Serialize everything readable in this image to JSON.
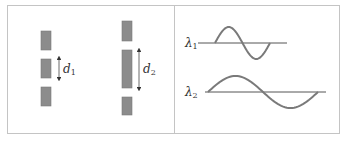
{
  "figure": {
    "left_panel": {
      "title": "Slits with separation",
      "bar_color": "#8c8c8c",
      "column_1": {
        "bars": [
          {
            "x": 41,
            "y": 31,
            "w": 10,
            "h": 19
          },
          {
            "x": 41,
            "y": 59,
            "w": 10,
            "h": 19
          },
          {
            "x": 41,
            "y": 87,
            "w": 10,
            "h": 19
          }
        ],
        "arrow": {
          "x": 59,
          "y1": 55,
          "y2": 82
        },
        "label": "d",
        "subscript": "1"
      },
      "column_2": {
        "bars": [
          {
            "x": 122,
            "y": 21,
            "w": 10,
            "h": 20
          },
          {
            "x": 122,
            "y": 50,
            "w": 10,
            "h": 38
          },
          {
            "x": 122,
            "y": 97,
            "w": 10,
            "h": 18
          }
        ],
        "arrow": {
          "x": 139,
          "y1": 47,
          "y2": 92
        },
        "label": "d",
        "subscript": "2"
      }
    },
    "right_panel": {
      "wave_color": "#7a7a7a",
      "axis_color": "#555555",
      "wave_1": {
        "label": "λ",
        "subscript": "1",
        "axis": {
          "x1": 198,
          "x2": 287,
          "y": 43
        },
        "start_x": 215,
        "end_x": 270,
        "amplitude": 16
      },
      "wave_2": {
        "label": "λ",
        "subscript": "2",
        "axis": {
          "x1": 205,
          "x2": 326,
          "y": 92
        },
        "start_x": 208,
        "end_x": 318,
        "amplitude": 16
      }
    }
  }
}
